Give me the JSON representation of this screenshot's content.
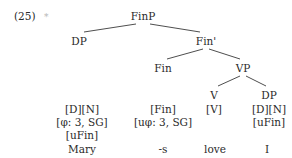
{
  "example": {
    "number": "(25)",
    "judgment": "*"
  },
  "tree": {
    "root": "FinP",
    "nodes": {
      "finp": "FinP",
      "dp_subject": "DP",
      "fin_bar": "Fin'",
      "fin": "Fin",
      "vp": "VP",
      "v": "V",
      "dp_object": "DP"
    },
    "leaves": [
      {
        "id": "mary",
        "features": [
          "[D][N]",
          "[φ: 3, SG]",
          "[uFin]"
        ],
        "word": "Mary"
      },
      {
        "id": "s",
        "features": [
          "[Fin]",
          "[uφ: 3, SG]"
        ],
        "word": "-s"
      },
      {
        "id": "love",
        "features": [
          "[V]"
        ],
        "word": "love"
      },
      {
        "id": "i",
        "features": [
          "[D][N]",
          "[uFin]"
        ],
        "word": "I"
      }
    ]
  }
}
